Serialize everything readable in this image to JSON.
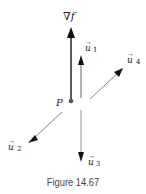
{
  "figure": {
    "caption": "Figure 14.67",
    "point": {
      "label": "P"
    },
    "gradient": {
      "label": "∇f"
    },
    "vectors": [
      {
        "id": "u1",
        "symbol": "u",
        "subscript": "1"
      },
      {
        "id": "u2",
        "symbol": "u",
        "subscript": "2"
      },
      {
        "id": "u3",
        "symbol": "u",
        "subscript": "3"
      },
      {
        "id": "u4",
        "symbol": "u",
        "subscript": "4"
      }
    ],
    "colors": {
      "gradient": "#333333",
      "vectors": "#555555",
      "point": "#555555"
    }
  }
}
